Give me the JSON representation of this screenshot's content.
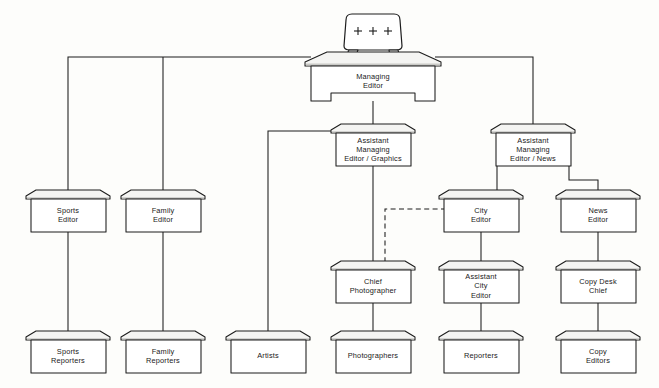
{
  "chart": {
    "type": "org-chart",
    "background_color": "#fdfdfb",
    "line_color": "#1c1c1c",
    "box_fill_color": "#ffffff",
    "box_top_color": "#f4f4f2",
    "nodes": [
      {
        "id": "managing_editor",
        "label": "Managing Editor",
        "lines": [
          "Managing",
          "Editor"
        ],
        "shape": "desk-with-chair",
        "level": 0,
        "x": 373,
        "y": 80
      },
      {
        "id": "asst_me_graphics",
        "label": "Assistant Managing Editor / Graphics",
        "lines": [
          "Assistant",
          "Managing",
          "Editor / Graphics"
        ],
        "shape": "desk",
        "level": 1,
        "x": 373,
        "y": 145
      },
      {
        "id": "asst_me_news",
        "label": "Assistant Managing Editor / News",
        "lines": [
          "Assistant",
          "Managing",
          "Editor / News"
        ],
        "shape": "desk",
        "level": 1,
        "x": 533,
        "y": 145
      },
      {
        "id": "sports_editor",
        "label": "Sports Editor",
        "lines": [
          "Sports",
          "Editor"
        ],
        "shape": "desk",
        "level": 2,
        "x": 68,
        "y": 211
      },
      {
        "id": "family_editor",
        "label": "Family Editor",
        "lines": [
          "Family",
          "Editor"
        ],
        "shape": "desk",
        "level": 2,
        "x": 163,
        "y": 211
      },
      {
        "id": "city_editor",
        "label": "City Editor",
        "lines": [
          "City",
          "Editor"
        ],
        "shape": "desk",
        "level": 2,
        "x": 481,
        "y": 211
      },
      {
        "id": "news_editor",
        "label": "News Editor",
        "lines": [
          "News",
          "Editor"
        ],
        "shape": "desk",
        "level": 2,
        "x": 598,
        "y": 211
      },
      {
        "id": "chief_photographer",
        "label": "Chief Photographer",
        "lines": [
          "Chief",
          "Photographer"
        ],
        "shape": "desk",
        "level": 3,
        "x": 373,
        "y": 282
      },
      {
        "id": "asst_city_editor",
        "label": "Assistant City Editor",
        "lines": [
          "Assistant",
          "City",
          "Editor"
        ],
        "shape": "desk",
        "level": 3,
        "x": 481,
        "y": 282
      },
      {
        "id": "copy_desk_chief",
        "label": "Copy Desk Chief",
        "lines": [
          "Copy Desk",
          "Chief"
        ],
        "shape": "desk",
        "level": 3,
        "x": 598,
        "y": 282
      },
      {
        "id": "sports_reporters",
        "label": "Sports Reporters",
        "lines": [
          "Sports",
          "Reporters"
        ],
        "shape": "desk",
        "level": 4,
        "x": 68,
        "y": 352
      },
      {
        "id": "family_reporters",
        "label": "Family Reporters",
        "lines": [
          "Family",
          "Reporters"
        ],
        "shape": "desk",
        "level": 4,
        "x": 163,
        "y": 352
      },
      {
        "id": "artists",
        "label": "Artists",
        "lines": [
          "Artists"
        ],
        "shape": "desk",
        "level": 4,
        "x": 268,
        "y": 352
      },
      {
        "id": "photographers",
        "label": "Photographers",
        "lines": [
          "Photographers"
        ],
        "shape": "desk",
        "level": 4,
        "x": 373,
        "y": 352
      },
      {
        "id": "reporters",
        "label": "Reporters",
        "lines": [
          "Reporters"
        ],
        "shape": "desk",
        "level": 4,
        "x": 481,
        "y": 352
      },
      {
        "id": "copy_editors",
        "label": "Copy Editors",
        "lines": [
          "Copy",
          "Editors"
        ],
        "shape": "desk",
        "level": 4,
        "x": 598,
        "y": 352
      }
    ],
    "edges": [
      {
        "from": "managing_editor",
        "to": "sports_editor",
        "style": "solid"
      },
      {
        "from": "managing_editor",
        "to": "family_editor",
        "style": "solid"
      },
      {
        "from": "managing_editor",
        "to": "asst_me_graphics",
        "style": "solid"
      },
      {
        "from": "managing_editor",
        "to": "asst_me_news",
        "style": "solid"
      },
      {
        "from": "asst_me_graphics",
        "to": "artists",
        "style": "solid"
      },
      {
        "from": "asst_me_graphics",
        "to": "chief_photographer",
        "style": "solid"
      },
      {
        "from": "asst_me_news",
        "to": "city_editor",
        "style": "solid"
      },
      {
        "from": "asst_me_news",
        "to": "news_editor",
        "style": "solid"
      },
      {
        "from": "city_editor",
        "to": "chief_photographer",
        "style": "dashed"
      },
      {
        "from": "city_editor",
        "to": "asst_city_editor",
        "style": "solid"
      },
      {
        "from": "news_editor",
        "to": "copy_desk_chief",
        "style": "solid"
      },
      {
        "from": "sports_editor",
        "to": "sports_reporters",
        "style": "solid"
      },
      {
        "from": "family_editor",
        "to": "family_reporters",
        "style": "solid"
      },
      {
        "from": "chief_photographer",
        "to": "photographers",
        "style": "solid"
      },
      {
        "from": "asst_city_editor",
        "to": "reporters",
        "style": "solid"
      },
      {
        "from": "copy_desk_chief",
        "to": "copy_editors",
        "style": "solid"
      }
    ],
    "chair": {
      "tuft_marks": [
        "+",
        "+",
        "+"
      ],
      "tuft_count": 3
    }
  }
}
